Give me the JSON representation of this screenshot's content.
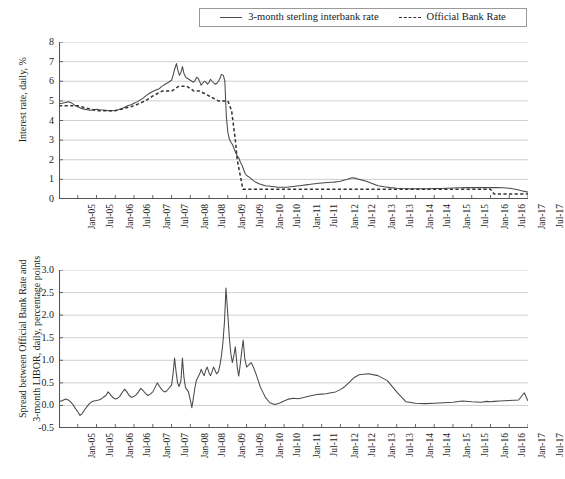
{
  "legend": {
    "items": [
      {
        "label": "3-month sterling interbank rate",
        "style": "solid",
        "color": "#4a4a4a"
      },
      {
        "label": "Official Bank Rate",
        "style": "dashed",
        "color": "#333333"
      }
    ]
  },
  "chart_data": [
    {
      "id": "interest-rates",
      "type": "line",
      "title": "",
      "xlabel": "",
      "ylabel": "Interest rate, daily, %",
      "ylim": [
        0,
        8
      ],
      "yticks": [
        0,
        1,
        2,
        3,
        4,
        5,
        6,
        7,
        8
      ],
      "ytick_labels": [
        "0",
        "1",
        "2",
        "3",
        "4",
        "5",
        "6",
        "7",
        "8"
      ],
      "grid": true,
      "legend_position": "top",
      "xlim": [
        "Jan-05",
        "Jul-17"
      ],
      "xticks": [
        "Jan-05",
        "Jul-05",
        "Jan-06",
        "Jul-06",
        "Jan-07",
        "Jul-07",
        "Jan-08",
        "Jul-08",
        "Jan-09",
        "Jul-09",
        "Jan-10",
        "Jul-10",
        "Jan-11",
        "Jul-11",
        "Jan-12",
        "Jul-12",
        "Jan-13",
        "Jul-13",
        "Jan-14",
        "Jul-14",
        "Jan-15",
        "Jul-15",
        "Jan-16",
        "Jul-16",
        "Jan-17",
        "Jul-17"
      ],
      "series": [
        {
          "name": "3-month sterling interbank rate",
          "style": "solid",
          "x": [
            0,
            0.08,
            0.17,
            0.25,
            0.33,
            0.42,
            0.5,
            0.58,
            0.67,
            0.75,
            0.83,
            0.92,
            1,
            1.08,
            1.17,
            1.25,
            1.33,
            1.42,
            1.5,
            1.58,
            1.67,
            1.75,
            1.83,
            1.92,
            2,
            2.08,
            2.17,
            2.25,
            2.33,
            2.42,
            2.5,
            2.58,
            2.67,
            2.75,
            2.83,
            2.92,
            3,
            3.04,
            3.08,
            3.13,
            3.17,
            3.21,
            3.25,
            3.29,
            3.33,
            3.38,
            3.42,
            3.46,
            3.5,
            3.54,
            3.58,
            3.63,
            3.67,
            3.71,
            3.75,
            3.79,
            3.83,
            3.88,
            3.92,
            3.96,
            4,
            4.04,
            4.08,
            4.13,
            4.17,
            4.21,
            4.25,
            4.29,
            4.33,
            4.38,
            4.42,
            4.46,
            4.5,
            4.54,
            4.58,
            4.63,
            4.67,
            4.71,
            4.75,
            4.79,
            4.83,
            4.88,
            4.92,
            4.96,
            5,
            5.08,
            5.17,
            5.25,
            5.33,
            5.42,
            5.5,
            5.58,
            5.67,
            5.75,
            5.83,
            5.92,
            6,
            6.08,
            6.17,
            6.25,
            6.33,
            6.42,
            6.5,
            6.58,
            6.67,
            6.75,
            6.83,
            6.92,
            7,
            7.08,
            7.17,
            7.25,
            7.33,
            7.42,
            7.5,
            7.58,
            7.67,
            7.75,
            7.83,
            7.92,
            8,
            8.17,
            8.33,
            8.5,
            8.67,
            8.83,
            9,
            9.17,
            9.33,
            9.5,
            9.67,
            9.83,
            10,
            10.17,
            10.33,
            10.5,
            10.67,
            10.83,
            11,
            11.17,
            11.33,
            11.5,
            11.67,
            11.83,
            12,
            12.17,
            12.33,
            12.5
          ],
          "y": [
            4.85,
            4.88,
            4.92,
            4.95,
            4.9,
            4.78,
            4.7,
            4.62,
            4.58,
            4.55,
            4.52,
            4.55,
            4.57,
            4.55,
            4.54,
            4.52,
            4.5,
            4.5,
            4.52,
            4.55,
            4.6,
            4.68,
            4.75,
            4.8,
            4.88,
            4.95,
            5.05,
            5.15,
            5.28,
            5.4,
            5.48,
            5.55,
            5.62,
            5.75,
            5.85,
            5.95,
            6.05,
            6.3,
            6.6,
            6.9,
            6.55,
            6.3,
            6.45,
            6.75,
            6.4,
            6.2,
            6.15,
            6.1,
            6.05,
            6.0,
            5.95,
            6.05,
            6.2,
            6.15,
            5.98,
            5.8,
            5.9,
            6.0,
            5.95,
            5.85,
            5.95,
            6.1,
            6.0,
            5.9,
            5.85,
            5.9,
            6.0,
            6.15,
            6.35,
            6.3,
            6.0,
            4.2,
            3.4,
            3.05,
            2.9,
            2.75,
            2.55,
            2.35,
            2.2,
            2.1,
            1.9,
            1.7,
            1.5,
            1.3,
            1.2,
            1.1,
            0.95,
            0.85,
            0.78,
            0.72,
            0.68,
            0.66,
            0.64,
            0.62,
            0.6,
            0.6,
            0.6,
            0.6,
            0.62,
            0.64,
            0.66,
            0.68,
            0.7,
            0.72,
            0.74,
            0.76,
            0.78,
            0.8,
            0.82,
            0.83,
            0.84,
            0.85,
            0.86,
            0.88,
            0.9,
            0.95,
            1.0,
            1.05,
            1.08,
            1.05,
            1.0,
            0.92,
            0.8,
            0.68,
            0.62,
            0.58,
            0.55,
            0.53,
            0.52,
            0.52,
            0.52,
            0.52,
            0.53,
            0.54,
            0.55,
            0.56,
            0.57,
            0.58,
            0.58,
            0.58,
            0.58,
            0.58,
            0.58,
            0.57,
            0.55,
            0.5,
            0.42,
            0.35,
            0.32,
            0.3,
            0.32,
            0.35,
            0.4
          ]
        },
        {
          "name": "Official Bank Rate",
          "style": "dashed",
          "x": [
            0,
            0.5,
            1,
            1.3,
            1.5,
            2,
            2.3,
            2.5,
            2.75,
            3,
            3.2,
            3.4,
            3.6,
            3.75,
            4,
            4.25,
            4.5,
            4.6,
            4.7,
            4.75,
            4.8,
            4.85,
            4.9,
            5,
            5.2,
            5.4,
            5.6,
            5.8,
            6,
            7,
            8,
            9,
            10,
            11,
            11.5,
            11.6,
            12,
            12.5
          ],
          "y": [
            4.75,
            4.75,
            4.5,
            4.5,
            4.5,
            4.75,
            5.0,
            5.25,
            5.5,
            5.5,
            5.75,
            5.75,
            5.5,
            5.5,
            5.25,
            5.0,
            5.0,
            4.5,
            3.0,
            2.0,
            1.5,
            1.0,
            0.5,
            0.5,
            0.5,
            0.5,
            0.5,
            0.5,
            0.5,
            0.5,
            0.5,
            0.5,
            0.5,
            0.5,
            0.5,
            0.25,
            0.25,
            0.25
          ]
        }
      ]
    },
    {
      "id": "libor-spread",
      "type": "line",
      "title": "",
      "xlabel": "",
      "ylabel": "Spread between Official Bank Rate and 3-month LIBOR, daily, percentage points",
      "ylabel_lines": [
        "Spread between Official Bank Rate and",
        "3-month LIBOR, daily, percentage points"
      ],
      "ylim": [
        -0.5,
        3.0
      ],
      "yticks": [
        -0.5,
        0.0,
        0.5,
        1.0,
        1.5,
        2.0,
        2.5,
        3.0
      ],
      "ytick_labels": [
        "-0.5",
        "0.0",
        "0.5",
        "1.0",
        "1.5",
        "2.0",
        "2.5",
        "3.0"
      ],
      "grid": true,
      "legend_position": "none",
      "xlim": [
        "Jan-05",
        "Jul-17"
      ],
      "xticks": [
        "Jan-05",
        "Jul-05",
        "Jan-06",
        "Jul-06",
        "Jan-07",
        "Jul-07",
        "Jan-08",
        "Jul-08",
        "Jan-09",
        "Jul-09",
        "Jan-10",
        "Jul-10",
        "Jan-11",
        "Jul-11",
        "Jan-12",
        "Jul-12",
        "Jan-13",
        "Jul-13",
        "Jan-14",
        "Jul-14",
        "Jan-15",
        "Jul-15",
        "Jan-16",
        "Jul-16",
        "Jan-17",
        "Jul-17"
      ],
      "series": [
        {
          "name": "Spread",
          "style": "solid",
          "x": [
            0,
            0.06,
            0.12,
            0.18,
            0.25,
            0.31,
            0.37,
            0.43,
            0.5,
            0.56,
            0.62,
            0.68,
            0.75,
            0.81,
            0.87,
            0.93,
            1,
            1.06,
            1.12,
            1.18,
            1.25,
            1.31,
            1.37,
            1.43,
            1.5,
            1.56,
            1.62,
            1.68,
            1.75,
            1.81,
            1.87,
            1.93,
            2,
            2.06,
            2.12,
            2.18,
            2.25,
            2.31,
            2.37,
            2.43,
            2.5,
            2.56,
            2.62,
            2.68,
            2.75,
            2.81,
            2.87,
            2.93,
            3,
            3.04,
            3.08,
            3.12,
            3.16,
            3.2,
            3.25,
            3.29,
            3.33,
            3.37,
            3.41,
            3.45,
            3.5,
            3.54,
            3.58,
            3.62,
            3.66,
            3.7,
            3.75,
            3.79,
            3.83,
            3.87,
            3.91,
            3.95,
            4,
            4.04,
            4.08,
            4.12,
            4.16,
            4.2,
            4.25,
            4.29,
            4.33,
            4.37,
            4.41,
            4.45,
            4.5,
            4.54,
            4.58,
            4.62,
            4.66,
            4.7,
            4.75,
            4.79,
            4.83,
            4.87,
            4.91,
            4.95,
            5,
            5.06,
            5.12,
            5.18,
            5.25,
            5.31,
            5.37,
            5.43,
            5.5,
            5.62,
            5.75,
            5.87,
            6,
            6.12,
            6.25,
            6.37,
            6.5,
            6.62,
            6.75,
            6.87,
            7,
            7.12,
            7.25,
            7.37,
            7.5,
            7.62,
            7.75,
            7.87,
            8,
            8.25,
            8.5,
            8.75,
            9,
            9.25,
            9.5,
            9.75,
            10,
            10.25,
            10.5,
            10.75,
            11,
            11.25,
            11.4,
            11.5,
            11.6,
            11.75,
            12,
            12.25,
            12.4,
            12.5
          ],
          "y": [
            0.08,
            0.1,
            0.12,
            0.14,
            0.12,
            0.08,
            0.02,
            -0.06,
            -0.14,
            -0.22,
            -0.18,
            -0.1,
            -0.02,
            0.04,
            0.08,
            0.1,
            0.11,
            0.12,
            0.14,
            0.18,
            0.22,
            0.3,
            0.24,
            0.18,
            0.14,
            0.16,
            0.2,
            0.28,
            0.36,
            0.3,
            0.22,
            0.18,
            0.2,
            0.24,
            0.3,
            0.38,
            0.32,
            0.26,
            0.22,
            0.25,
            0.3,
            0.4,
            0.5,
            0.42,
            0.34,
            0.3,
            0.32,
            0.38,
            0.45,
            0.7,
            1.05,
            0.75,
            0.5,
            0.42,
            0.55,
            1.05,
            0.62,
            0.4,
            0.35,
            0.3,
            0.12,
            -0.05,
            0.15,
            0.38,
            0.55,
            0.62,
            0.7,
            0.8,
            0.72,
            0.66,
            0.78,
            0.85,
            0.72,
            0.66,
            0.75,
            0.85,
            0.78,
            0.7,
            0.75,
            0.9,
            1.1,
            1.4,
            1.85,
            2.6,
            2.0,
            1.5,
            1.15,
            0.95,
            1.1,
            1.3,
            0.85,
            0.65,
            0.9,
            1.2,
            1.45,
            1.05,
            0.85,
            0.9,
            0.95,
            0.85,
            0.7,
            0.55,
            0.4,
            0.3,
            0.18,
            0.06,
            0.02,
            0.05,
            0.1,
            0.14,
            0.16,
            0.15,
            0.17,
            0.2,
            0.22,
            0.24,
            0.25,
            0.26,
            0.28,
            0.3,
            0.35,
            0.42,
            0.52,
            0.62,
            0.68,
            0.7,
            0.66,
            0.55,
            0.3,
            0.08,
            0.05,
            0.04,
            0.05,
            0.06,
            0.07,
            0.1,
            0.08,
            0.07,
            0.09,
            0.08,
            0.09,
            0.1,
            0.11,
            0.12,
            0.28,
            0.1,
            0.09,
            0.1,
            0.12,
            0.11,
            0.04,
            0.12
          ]
        }
      ]
    }
  ],
  "colors": {
    "line": "#4a4a4a",
    "dash": "#333333",
    "grid": "#c9c9c9",
    "axis": "#555555",
    "text": "#1a1a1a"
  }
}
